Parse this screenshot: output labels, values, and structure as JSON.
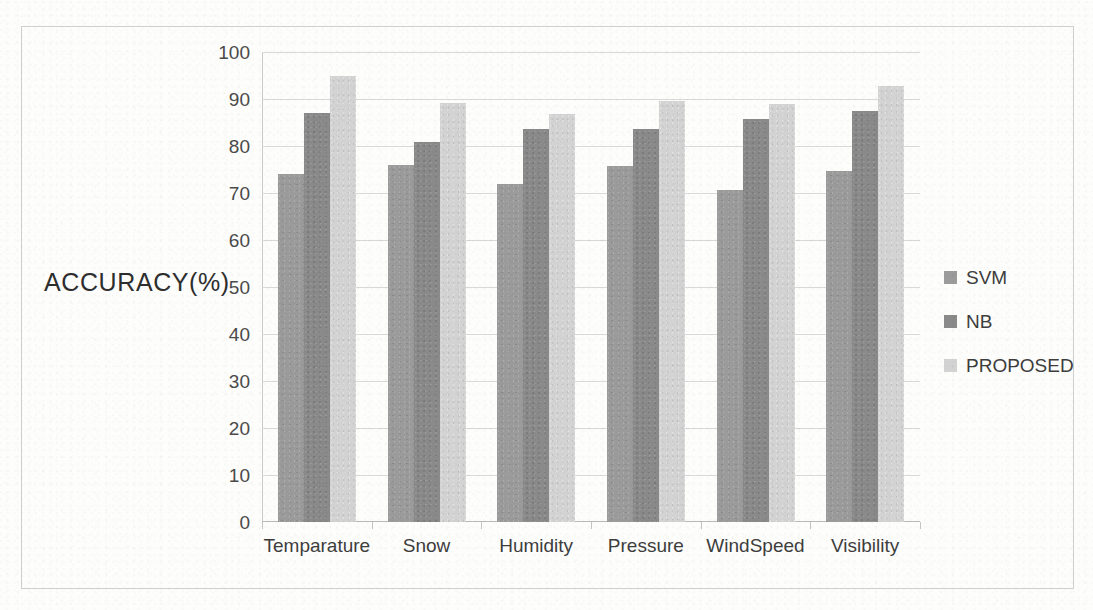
{
  "chart_data": {
    "type": "bar",
    "title": "",
    "xlabel": "",
    "ylabel": "ACCURACY(%)",
    "categories": [
      "Temparature",
      "Snow",
      "Humidity",
      "Pressure",
      "WindSpeed",
      "Visibility"
    ],
    "series": [
      {
        "name": "SVM",
        "color": "#9b9b9b",
        "values": [
          74.1,
          75.9,
          71.9,
          75.7,
          70.6,
          74.7
        ]
      },
      {
        "name": "NB",
        "color": "#8a8a8a",
        "values": [
          87.1,
          80.9,
          83.7,
          83.7,
          85.8,
          87.5
        ]
      },
      {
        "name": "PROPOSED",
        "color": "#d3d3d3",
        "values": [
          95.0,
          89.1,
          86.9,
          89.6,
          88.9,
          92.8
        ]
      }
    ],
    "ylim": [
      0,
      100
    ],
    "yticks": [
      0,
      10,
      20,
      30,
      40,
      50,
      60,
      70,
      80,
      90,
      100
    ],
    "ytick_labels": [
      "0",
      "10",
      "20",
      "30",
      "40",
      "50",
      "60",
      "70",
      "80",
      "90",
      "100"
    ],
    "grid": true,
    "grid_axis": "y",
    "legend_position": "right",
    "legend_entries": [
      "SVM",
      "NB",
      "PROPOSED"
    ]
  },
  "axis": {
    "y_title": "ACCURACY(%)"
  },
  "legend": {
    "items": [
      {
        "label": "SVM"
      },
      {
        "label": "NB"
      },
      {
        "label": "PROPOSED"
      }
    ]
  },
  "colors": {
    "svm": "#9b9b9b",
    "nb": "#8a8a8a",
    "proposed": "#d3d3d3",
    "gridline": "#d9d9d9",
    "frame": "#cfcfcf",
    "background": "#fdfdfc"
  }
}
